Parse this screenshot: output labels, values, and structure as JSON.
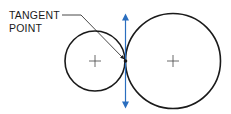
{
  "diagram": {
    "label": {
      "line1": "TANGENT",
      "line2": "POINT"
    },
    "colors": {
      "stroke": "#1a1a1a",
      "tangent_line": "#2a6ebf",
      "background": "#ffffff"
    },
    "circles": [
      {
        "name": "small-circle",
        "cx": 95,
        "cy": 61,
        "r": 30
      },
      {
        "name": "large-circle",
        "cx": 173,
        "cy": 61,
        "r": 47
      }
    ],
    "tangent_point": {
      "x": 125.5,
      "y": 61
    },
    "tangent_line": {
      "x": 125.5,
      "y1": 14,
      "y2": 108
    }
  }
}
